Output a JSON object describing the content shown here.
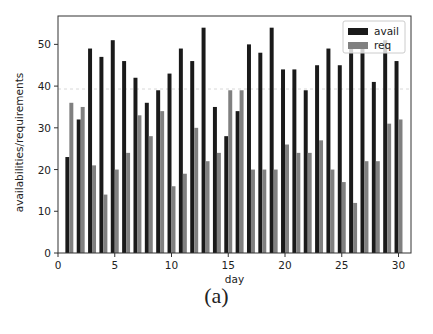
{
  "chart_data": {
    "type": "bar",
    "title": "",
    "xlabel": "day",
    "ylabel": "availabilities/requirements",
    "caption": "(a)",
    "x": [
      1,
      2,
      3,
      4,
      5,
      6,
      7,
      8,
      9,
      10,
      11,
      12,
      13,
      14,
      15,
      16,
      17,
      18,
      19,
      20,
      21,
      22,
      23,
      24,
      25,
      26,
      27,
      28,
      29,
      30
    ],
    "series": [
      {
        "name": "avail",
        "color": "#1a1a1a",
        "values": [
          23,
          32,
          49,
          47,
          51,
          46,
          42,
          36,
          39,
          43,
          49,
          46,
          54,
          35,
          28,
          34,
          50,
          48,
          54,
          44,
          44,
          39,
          45,
          49,
          45,
          50,
          50,
          41,
          51,
          46
        ]
      },
      {
        "name": "req",
        "color": "#808080",
        "values": [
          36,
          35,
          21,
          14,
          20,
          24,
          33,
          28,
          34,
          16,
          19,
          30,
          22,
          24,
          39,
          39,
          20,
          20,
          20,
          26,
          24,
          24,
          27,
          20,
          17,
          12,
          22,
          22,
          31,
          32
        ]
      }
    ],
    "xlim": [
      0,
      31.1
    ],
    "ylim": [
      0,
      56.8
    ],
    "xticks": [
      0,
      5,
      10,
      15,
      20,
      25,
      30
    ],
    "yticks": [
      0,
      10,
      20,
      30,
      40,
      50
    ],
    "grid": false,
    "reference_line": {
      "y": 39.3,
      "style": "dashed",
      "color": "#d8d8d8"
    },
    "legend": {
      "position": "upper right",
      "entries": [
        "avail",
        "req"
      ]
    },
    "bar_width": 0.35
  }
}
